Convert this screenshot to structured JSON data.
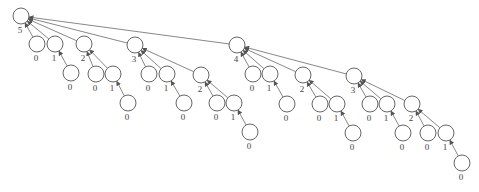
{
  "diagram": {
    "type": "binomial-tree",
    "title": "",
    "node_radius": 8,
    "label_offset": 13,
    "colors": {
      "edge": "#6a6a6a",
      "node_stroke": "#555555",
      "label": "#444444"
    },
    "nodes": [
      {
        "id": "r",
        "label": "5",
        "x": 21,
        "y": 16,
        "parent": null
      },
      {
        "id": "a0",
        "label": "0",
        "x": 37,
        "y": 44,
        "parent": "r"
      },
      {
        "id": "a1",
        "label": "1",
        "x": 55,
        "y": 44,
        "parent": "r"
      },
      {
        "id": "a1a",
        "label": "0",
        "x": 71,
        "y": 73,
        "parent": "a1"
      },
      {
        "id": "a2",
        "label": "2",
        "x": 84,
        "y": 44,
        "parent": "r"
      },
      {
        "id": "a2a",
        "label": "0",
        "x": 96,
        "y": 74,
        "parent": "a2"
      },
      {
        "id": "a2b",
        "label": "1",
        "x": 113,
        "y": 74,
        "parent": "a2"
      },
      {
        "id": "a2c",
        "label": "0",
        "x": 128,
        "y": 103,
        "parent": "a2b"
      },
      {
        "id": "b",
        "label": "3",
        "x": 135,
        "y": 45,
        "parent": "r"
      },
      {
        "id": "b0",
        "label": "0",
        "x": 149,
        "y": 74,
        "parent": "b"
      },
      {
        "id": "b1",
        "label": "1",
        "x": 167,
        "y": 74,
        "parent": "b"
      },
      {
        "id": "b1a",
        "label": "0",
        "x": 184,
        "y": 103,
        "parent": "b1"
      },
      {
        "id": "b2",
        "label": "2",
        "x": 201,
        "y": 75,
        "parent": "b"
      },
      {
        "id": "b2a",
        "label": "0",
        "x": 217,
        "y": 103,
        "parent": "b2"
      },
      {
        "id": "b2b",
        "label": "1",
        "x": 234,
        "y": 103,
        "parent": "b2"
      },
      {
        "id": "b2c",
        "label": "0",
        "x": 250,
        "y": 132,
        "parent": "b2b"
      },
      {
        "id": "c",
        "label": "4",
        "x": 237,
        "y": 45,
        "parent": "r"
      },
      {
        "id": "c0",
        "label": "0",
        "x": 253,
        "y": 74,
        "parent": "c"
      },
      {
        "id": "c1",
        "label": "1",
        "x": 270,
        "y": 74,
        "parent": "c"
      },
      {
        "id": "c1a",
        "label": "0",
        "x": 287,
        "y": 104,
        "parent": "c1"
      },
      {
        "id": "c2",
        "label": "2",
        "x": 303,
        "y": 75,
        "parent": "c"
      },
      {
        "id": "c2a",
        "label": "0",
        "x": 320,
        "y": 104,
        "parent": "c2"
      },
      {
        "id": "c2b",
        "label": "1",
        "x": 337,
        "y": 104,
        "parent": "c2"
      },
      {
        "id": "c2c",
        "label": "0",
        "x": 353,
        "y": 133,
        "parent": "c2b"
      },
      {
        "id": "d",
        "label": "3",
        "x": 354,
        "y": 76,
        "parent": "c"
      },
      {
        "id": "d0",
        "label": "0",
        "x": 370,
        "y": 104,
        "parent": "d"
      },
      {
        "id": "d1",
        "label": "1",
        "x": 387,
        "y": 104,
        "parent": "d"
      },
      {
        "id": "d1a",
        "label": "0",
        "x": 403,
        "y": 133,
        "parent": "d1"
      },
      {
        "id": "d2",
        "label": "2",
        "x": 412,
        "y": 104,
        "parent": "d"
      },
      {
        "id": "d2a",
        "label": "0",
        "x": 428,
        "y": 133,
        "parent": "d2"
      },
      {
        "id": "d2b",
        "label": "1",
        "x": 446,
        "y": 133,
        "parent": "d2"
      },
      {
        "id": "d2c",
        "label": "0",
        "x": 462,
        "y": 163,
        "parent": "d2b"
      }
    ]
  }
}
